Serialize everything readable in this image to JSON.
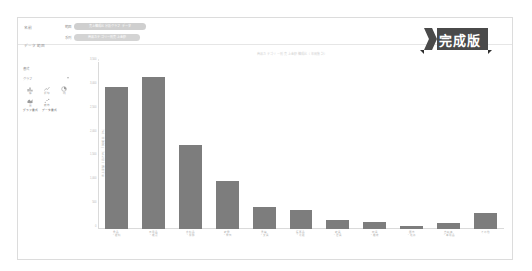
{
  "window": {
    "title_label": "名前",
    "subtitle_label": "データ範囲",
    "fields": [
      {
        "label": "範囲",
        "value": "売上構成比分析グラフ データ"
      },
      {
        "label": "系列",
        "value": "商品カテゴリー別売上金額"
      }
    ]
  },
  "tool_panel": {
    "heading": "書式",
    "select_value": "グラフ",
    "icons": [
      {
        "name": "chart-bar-icon",
        "caption": "棒"
      },
      {
        "name": "chart-line-icon",
        "caption": "折線"
      },
      {
        "name": "chart-pie-icon",
        "caption": "円"
      },
      {
        "name": "chart-area-icon",
        "caption": "面"
      },
      {
        "name": "chart-scatter-icon",
        "caption": "散布"
      }
    ],
    "footer_buttons": [
      "グラフ書式",
      "データ書式"
    ]
  },
  "ribbon": {
    "label": "完成版",
    "color": "#4a4a4a"
  },
  "chart_data": {
    "type": "bar",
    "title": "商品カテゴリー別 売上金額構成比（年間集計）",
    "xlabel": "",
    "ylabel": "売上金額（百万円） / 構成比（％）",
    "ylim": [
      0,
      3500
    ],
    "yticks": [
      0,
      500,
      1000,
      1500,
      2000,
      2500,
      3000,
      3500
    ],
    "ytick_labels": [
      "0",
      "500",
      "1,000",
      "1,500",
      "2,000",
      "2,500",
      "3,000",
      "3,500"
    ],
    "grid": false,
    "legend": "none",
    "bar_color": "#7d7d7d",
    "categories": [
      "食品\n・飲料",
      "日用品\n・雑貨",
      "衣料品\n・服飾",
      "家電\n・電気",
      "書籍\n・文具",
      "医薬品\n・化粧",
      "家具\n・寝具",
      "玩具\n・趣味",
      "園芸\n・花卉",
      "自転車\n・車用品",
      "その他"
    ],
    "values": [
      2980,
      3180,
      1760,
      1010,
      470,
      400,
      190,
      155,
      60,
      120,
      330
    ]
  }
}
